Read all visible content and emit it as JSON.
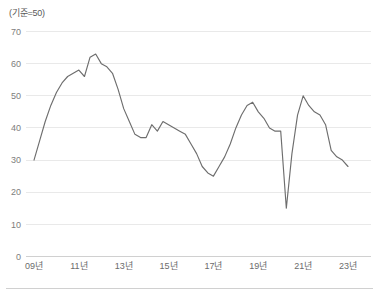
{
  "chart_data": {
    "type": "line",
    "title": "",
    "unit_label": "(기준=50)",
    "xlabel": "",
    "ylabel": "",
    "ylim": [
      0,
      70
    ],
    "yticks": [
      0,
      10,
      20,
      30,
      40,
      50,
      60,
      70
    ],
    "xticks": [
      "09년",
      "11년",
      "13년",
      "15년",
      "17년",
      "19년",
      "21년",
      "23년"
    ],
    "xtick_values": [
      2009,
      2011,
      2013,
      2015,
      2017,
      2019,
      2021,
      2023
    ],
    "grid": true,
    "legend": "none",
    "line_color": "#6e6e6e",
    "series": [
      {
        "name": "지수",
        "x": [
          2009.0,
          2009.25,
          2009.5,
          2009.75,
          2010.0,
          2010.25,
          2010.5,
          2010.75,
          2011.0,
          2011.25,
          2011.5,
          2011.75,
          2012.0,
          2012.25,
          2012.5,
          2012.75,
          2013.0,
          2013.25,
          2013.5,
          2013.75,
          2014.0,
          2014.25,
          2014.5,
          2014.75,
          2015.0,
          2015.25,
          2015.5,
          2015.75,
          2016.0,
          2016.25,
          2016.5,
          2016.75,
          2017.0,
          2017.25,
          2017.5,
          2017.75,
          2018.0,
          2018.25,
          2018.5,
          2018.75,
          2019.0,
          2019.25,
          2019.5,
          2019.75,
          2020.0,
          2020.25,
          2020.5,
          2020.75,
          2021.0,
          2021.25,
          2021.5,
          2021.75,
          2022.0,
          2022.25,
          2022.5,
          2022.75,
          2023.0
        ],
        "values": [
          30,
          36,
          42,
          47,
          51,
          54,
          56,
          57,
          58,
          56,
          62,
          63,
          60,
          59,
          57,
          52,
          46,
          42,
          38,
          37,
          37,
          41,
          39,
          42,
          41,
          40,
          39,
          38,
          35,
          32,
          28,
          26,
          25,
          28,
          31,
          35,
          40,
          44,
          47,
          48,
          45,
          43,
          40,
          39,
          39,
          15,
          32,
          44,
          50,
          47,
          45,
          44,
          41,
          33,
          31,
          30,
          28
        ]
      }
    ]
  }
}
